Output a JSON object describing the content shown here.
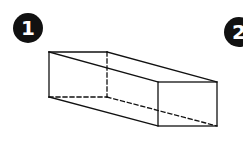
{
  "figures": [
    {
      "label": "1",
      "shape": "rectangular-prism-wireframe"
    },
    {
      "label": "2",
      "shape": "clipped"
    }
  ],
  "colors": {
    "ink": "#111111",
    "background": "#ffffff"
  }
}
